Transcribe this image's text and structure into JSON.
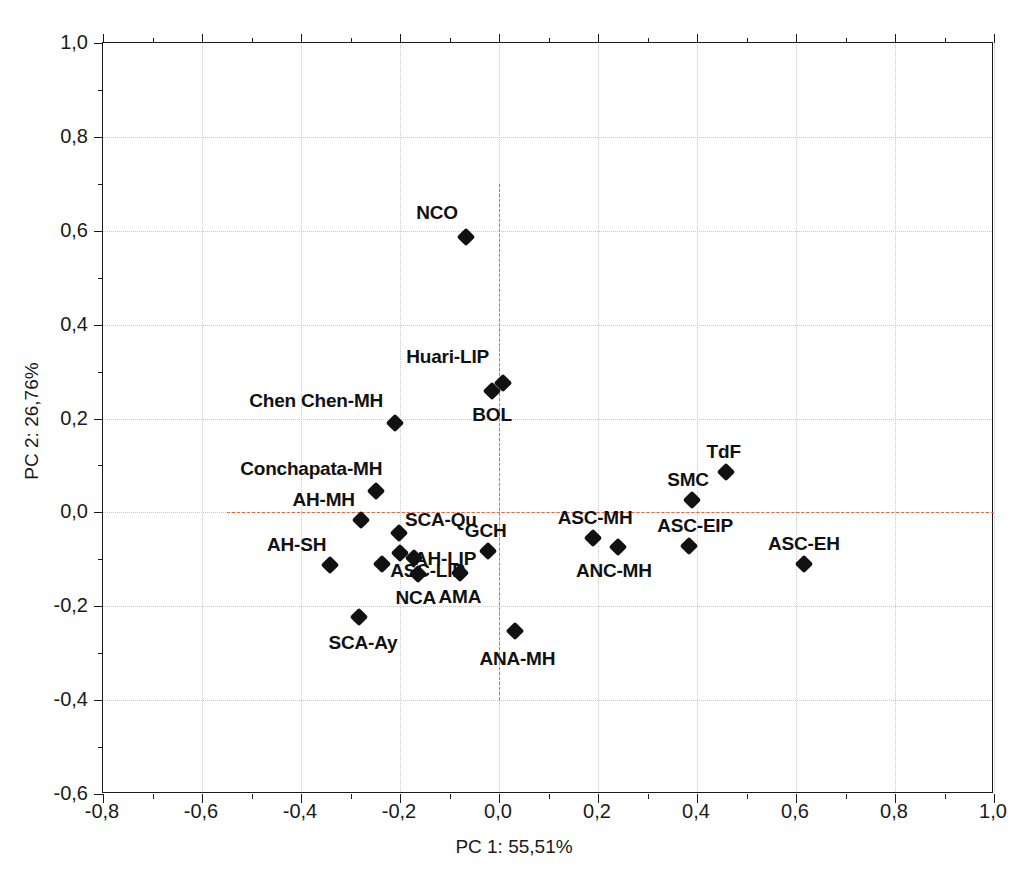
{
  "chart_data": {
    "type": "scatter",
    "title": "",
    "xlabel": "PC 1: 55,51%",
    "ylabel": "PC 2: 26,76%",
    "xlim": [
      -0.8,
      1.0
    ],
    "ylim": [
      -0.6,
      1.0
    ],
    "xticks": [
      "-0,8",
      "-0,6",
      "-0,4",
      "-0,2",
      "0,0",
      "0,2",
      "0,4",
      "0,6",
      "0,8",
      "1,0"
    ],
    "xtick_values": [
      -0.8,
      -0.6,
      -0.4,
      -0.2,
      0.0,
      0.2,
      0.4,
      0.6,
      0.8,
      1.0
    ],
    "yticks": [
      "-0,6",
      "-0,4",
      "-0,2",
      "0,0",
      "0,2",
      "0,4",
      "0,6",
      "0,8",
      "1,0"
    ],
    "ytick_values": [
      -0.6,
      -0.4,
      -0.2,
      0.0,
      0.2,
      0.4,
      0.6,
      0.8,
      1.0
    ],
    "grid": true,
    "legend": "none",
    "marker_style": "filled-diamond",
    "marker_color": "#111111",
    "reference_lines": {
      "color": "#e8673c",
      "style": "dashed",
      "vertical_x": 0.0,
      "vertical_y_range": [
        -0.4,
        0.7
      ],
      "horizontal_y": 0.0,
      "horizontal_x_range": [
        -0.55,
        1.0
      ]
    },
    "points": [
      {
        "label": "NCO",
        "x": -0.067,
        "y": 0.587,
        "label_dx": -8,
        "label_dy": -24,
        "anchor": "end"
      },
      {
        "label": "Huari-LIP",
        "x": 0.008,
        "y": 0.276,
        "label_dx": -14,
        "label_dy": -26,
        "anchor": "end"
      },
      {
        "label": "BOL",
        "x": -0.014,
        "y": 0.259,
        "label_dx": 0,
        "label_dy": 24,
        "anchor": "middle"
      },
      {
        "label": "Chen Chen-MH",
        "x": -0.21,
        "y": 0.191,
        "label_dx": -12,
        "label_dy": -22,
        "anchor": "end"
      },
      {
        "label": "Conchapata-MH",
        "x": -0.248,
        "y": 0.046,
        "label_dx": 6,
        "label_dy": -22,
        "anchor": "end"
      },
      {
        "label": "AH-MH",
        "x": -0.279,
        "y": -0.016,
        "label_dx": -6,
        "label_dy": -20,
        "anchor": "end"
      },
      {
        "label": "SCA-Qu",
        "x": -0.202,
        "y": -0.044,
        "label_dx": 6,
        "label_dy": -13,
        "anchor": "start"
      },
      {
        "label": "AH-LIP",
        "x": -0.2,
        "y": -0.086,
        "label_dx": 14,
        "label_dy": 6,
        "anchor": "start"
      },
      {
        "label": "",
        "x": -0.172,
        "y": -0.097,
        "label_dx": 0,
        "label_dy": 0,
        "anchor": "middle"
      },
      {
        "label": "AH-SH",
        "x": -0.341,
        "y": -0.112,
        "label_dx": -4,
        "label_dy": -20,
        "anchor": "end"
      },
      {
        "label": "ASC-LIP",
        "x": -0.236,
        "y": -0.11,
        "label_dx": 8,
        "label_dy": 7,
        "anchor": "start"
      },
      {
        "label": "NCA",
        "x": -0.164,
        "y": -0.131,
        "label_dx": -2,
        "label_dy": 24,
        "anchor": "middle"
      },
      {
        "label": "AMA",
        "x": -0.079,
        "y": -0.129,
        "label_dx": 0,
        "label_dy": 24,
        "anchor": "middle"
      },
      {
        "label": "GCH",
        "x": -0.023,
        "y": -0.082,
        "label_dx": -2,
        "label_dy": -20,
        "anchor": "middle"
      },
      {
        "label": "SCA-Ay",
        "x": -0.283,
        "y": -0.222,
        "label_dx": 4,
        "label_dy": 26,
        "anchor": "middle"
      },
      {
        "label": "ANA-MH",
        "x": 0.033,
        "y": -0.252,
        "label_dx": 2,
        "label_dy": 28,
        "anchor": "middle"
      },
      {
        "label": "ASC-MH",
        "x": 0.19,
        "y": -0.054,
        "label_dx": 2,
        "label_dy": -20,
        "anchor": "middle"
      },
      {
        "label": "ANC-MH",
        "x": 0.24,
        "y": -0.073,
        "label_dx": -4,
        "label_dy": 24,
        "anchor": "middle"
      },
      {
        "label": "SMC",
        "x": 0.39,
        "y": 0.026,
        "label_dx": -4,
        "label_dy": -20,
        "anchor": "middle"
      },
      {
        "label": "TdF",
        "x": 0.458,
        "y": 0.086,
        "label_dx": -2,
        "label_dy": -20,
        "anchor": "middle"
      },
      {
        "label": "ASC-EIP",
        "x": 0.384,
        "y": -0.071,
        "label_dx": 6,
        "label_dy": -20,
        "anchor": "middle"
      },
      {
        "label": "ASC-EH",
        "x": 0.616,
        "y": -0.109,
        "label_dx": 0,
        "label_dy": -20,
        "anchor": "middle"
      }
    ]
  }
}
